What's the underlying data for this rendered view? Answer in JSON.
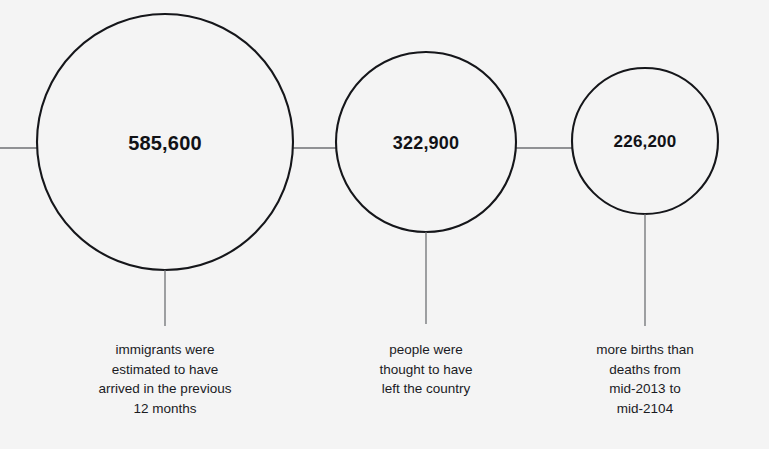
{
  "chart_data": {
    "type": "bar",
    "title": "",
    "subtitle": "",
    "xlabel": "",
    "ylabel": "",
    "categories": [
      "immigrants arrived",
      "people left the country",
      "more births than deaths"
    ],
    "values": [
      585600,
      322900,
      226200
    ],
    "value_labels": [
      "585,600",
      "322,900",
      "226,200"
    ],
    "legend": [],
    "annotations": [
      "immigrants were estimated to have arrived in the previous 12 months",
      "people were thought to have left the country",
      "more births than deaths from mid-2013 to mid-2104"
    ],
    "grid": false
  },
  "style": {
    "background": "#f4f4f4",
    "stroke": "#15161a",
    "connector": "#6f7174",
    "text": "#15161a"
  },
  "bubbles": [
    {
      "id": "bubble-immigrants",
      "value_label": "585,600",
      "caption": "immigrants were\nestimated to have\narrived in the previous\n12 months",
      "cx": 165,
      "cy": 142,
      "r": 128,
      "stem_top": 270,
      "stem_bottom": 326,
      "caption_top": 340
    },
    {
      "id": "bubble-emigrants",
      "value_label": "322,900",
      "caption": "people were\nthought to have\nleft the country",
      "cx": 426,
      "cy": 142,
      "r": 90,
      "stem_top": 232,
      "stem_bottom": 324,
      "caption_top": 340
    },
    {
      "id": "bubble-natural-change",
      "value_label": "226,200",
      "caption": "more births than\ndeaths from\nmid-2013 to\nmid-2104",
      "cx": 645,
      "cy": 141,
      "r": 73,
      "stem_top": 214,
      "stem_bottom": 326,
      "caption_top": 340
    }
  ],
  "connectors": [
    {
      "id": "connector-left-edge",
      "x1": 0,
      "x2": 37,
      "y": 148
    },
    {
      "id": "connector-one-two",
      "x1": 293,
      "x2": 336,
      "y": 148
    },
    {
      "id": "connector-two-three",
      "x1": 516,
      "x2": 572,
      "y": 148
    }
  ]
}
